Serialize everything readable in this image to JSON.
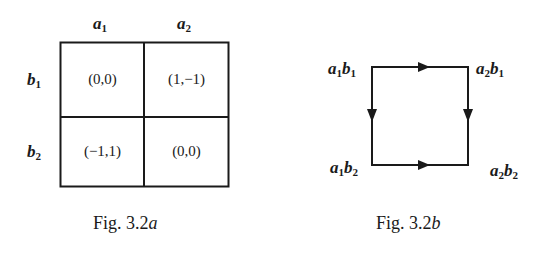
{
  "figure_a": {
    "columns": [
      {
        "var": "a",
        "sub": "1"
      },
      {
        "var": "a",
        "sub": "2"
      }
    ],
    "rows": [
      {
        "var": "b",
        "sub": "1"
      },
      {
        "var": "b",
        "sub": "2"
      }
    ],
    "cells": [
      [
        "(0,0)",
        "(1,−1)"
      ],
      [
        "(−1,1)",
        "(0,0)"
      ]
    ],
    "caption_prefix": "Fig. 3.2",
    "caption_suffix": "a"
  },
  "figure_b": {
    "nodes": {
      "top_left": {
        "a": "a",
        "a_sub": "1",
        "b": "b",
        "b_sub": "1"
      },
      "top_right": {
        "a": "a",
        "a_sub": "2",
        "b": "b",
        "b_sub": "1"
      },
      "bottom_left": {
        "a": "a",
        "a_sub": "1",
        "b": "b",
        "b_sub": "2"
      },
      "bottom_right": {
        "a": "a",
        "a_sub": "2",
        "b": "b",
        "b_sub": "2"
      }
    },
    "edges": [
      {
        "from": "a1b1",
        "to": "a2b1",
        "direction": "right"
      },
      {
        "from": "a1b1",
        "to": "a1b2",
        "direction": "down"
      },
      {
        "from": "a2b1",
        "to": "a2b2",
        "direction": "down"
      },
      {
        "from": "a1b2",
        "to": "a2b2",
        "direction": "right"
      }
    ],
    "caption_prefix": "Fig. 3.2",
    "caption_suffix": "b"
  }
}
